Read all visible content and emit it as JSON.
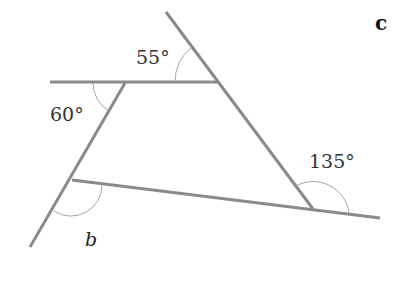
{
  "diagram": {
    "part_label": "c",
    "colors": {
      "line": "#8a8a8a",
      "arc": "#9a9a9a",
      "text": "#333333"
    },
    "lines": [
      {
        "name": "top-horizontal-line",
        "x1": 50,
        "y1": 82,
        "x2": 218,
        "y2": 82
      },
      {
        "name": "right-slanted-line",
        "x1": 166,
        "y1": 12,
        "x2": 313,
        "y2": 209
      },
      {
        "name": "left-slanted-line",
        "x1": 125,
        "y1": 83,
        "x2": 30,
        "y2": 247
      },
      {
        "name": "bottom-line",
        "x1": 72,
        "y1": 180,
        "x2": 380,
        "y2": 218
      }
    ],
    "angles": [
      {
        "name": "angle-55",
        "label": "55°",
        "vertex": [
          218,
          82
        ]
      },
      {
        "name": "angle-60",
        "label": "60°",
        "vertex": [
          125,
          83
        ]
      },
      {
        "name": "angle-135",
        "label": "135°",
        "vertex": [
          313,
          209
        ]
      },
      {
        "name": "angle-b",
        "label": "b",
        "vertex": [
          72,
          180
        ]
      }
    ]
  }
}
